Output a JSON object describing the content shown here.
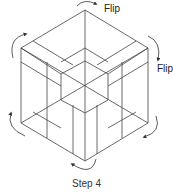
{
  "diagram": {
    "caption": "Step 4",
    "labels": {
      "flip_top": "Flip",
      "flip_right": "Flip"
    },
    "colors": {
      "line": "#444444",
      "text": "#222222",
      "background": "#ffffff"
    },
    "arrows": [
      "rotate-arrow-top",
      "rotate-arrow-top-left",
      "rotate-arrow-top-right",
      "rotate-arrow-bottom-left",
      "rotate-arrow-bottom-right",
      "rotate-arrow-bottom"
    ]
  }
}
